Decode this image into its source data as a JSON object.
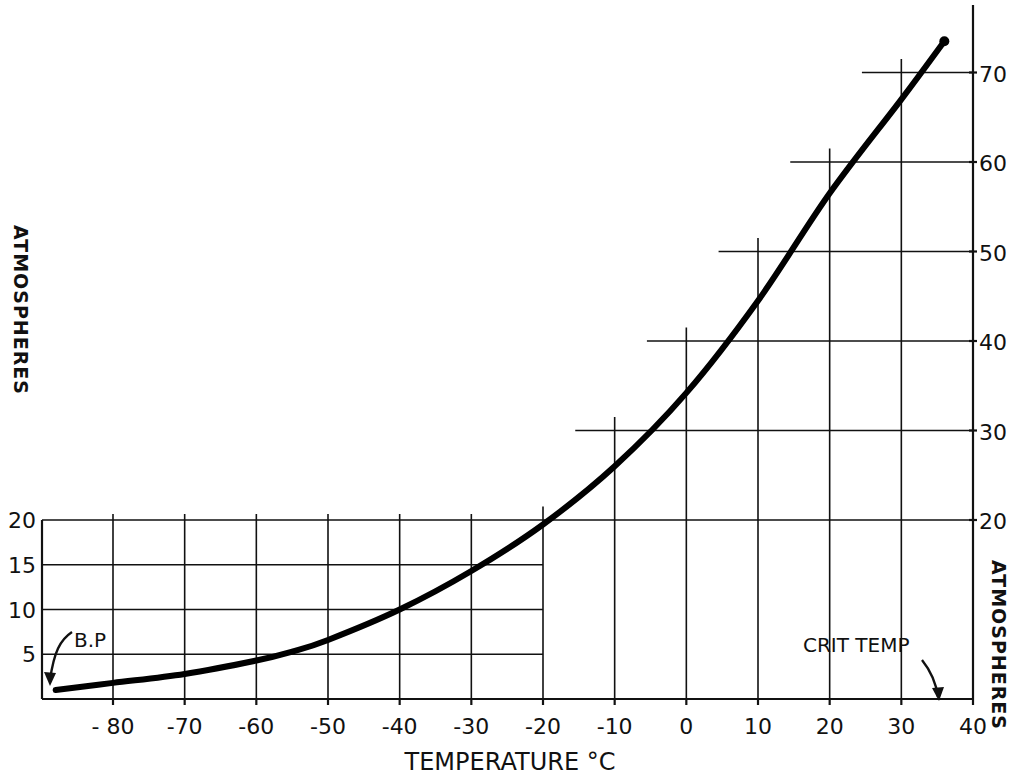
{
  "chart_data": {
    "type": "line",
    "title": "",
    "xlabel": "TEMPERATURE °C",
    "ylabel_left": "ATMOSPHERES",
    "ylabel_right": "ATMOSPHERES",
    "xlim": [
      -90,
      40
    ],
    "ylim": [
      0,
      75
    ],
    "grid": true,
    "x_ticks": [
      -80,
      -70,
      -60,
      -50,
      -40,
      -30,
      -20,
      -10,
      0,
      10,
      20,
      30,
      40
    ],
    "x_tick_labels": [
      "- 80",
      "-70",
      "-60",
      "-50",
      "-40",
      "-30",
      "-20",
      "-10",
      "0",
      "10",
      "20",
      "30",
      "40"
    ],
    "y_ticks_left": [
      5,
      10,
      15,
      20
    ],
    "y_ticks_right": [
      20,
      30,
      40,
      50,
      60,
      70
    ],
    "series": [
      {
        "name": "Vapour pressure curve",
        "x": [
          -88,
          -80,
          -70,
          -60,
          -55,
          -50,
          -40,
          -30,
          -20,
          -10,
          0,
          10,
          20,
          30,
          36
        ],
        "values": [
          1.0,
          1.8,
          2.8,
          4.3,
          5.3,
          6.6,
          10.0,
          14.3,
          19.5,
          26.0,
          34.2,
          44.5,
          56.5,
          67.0,
          73.5
        ]
      }
    ],
    "annotations": [
      {
        "text": "B.P",
        "x": -88,
        "y": 1
      },
      {
        "text": "CRIT TEMP",
        "x": 36,
        "y": 0
      }
    ],
    "endpoint_marker": {
      "x": 36,
      "y": 73.5
    }
  }
}
